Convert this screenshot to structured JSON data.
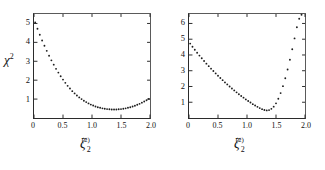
{
  "figure": {
    "background": "#ffffff",
    "ink_color": "#1d1d1d"
  },
  "chart_data": [
    {
      "type": "scatter",
      "panel_id": "I",
      "title": "",
      "xlabel": "ζ",
      "xlabel_sub": "2",
      "xlabel_sup": "(2)",
      "ylabel": "χ",
      "ylabel_sup": "2",
      "y_multiplier_text": "x 10",
      "y_multiplier_exp": "-4",
      "y_scale": 0.0001,
      "xlim": [
        0,
        2.0
      ],
      "ylim": [
        0,
        5.5
      ],
      "xticks": [
        0,
        0.5,
        1.0,
        1.5,
        2.0
      ],
      "xtick_labels": [
        "0",
        "0.5",
        "1.0",
        "1.5",
        "2.0"
      ],
      "yticks": [
        1,
        2,
        3,
        4,
        5
      ],
      "ytick_labels": [
        "1",
        "2",
        "3",
        "4",
        "5"
      ],
      "grid": false,
      "legend": "none",
      "x": [
        0.02,
        0.06,
        0.1,
        0.14,
        0.18,
        0.22,
        0.26,
        0.3,
        0.34,
        0.38,
        0.42,
        0.46,
        0.5,
        0.54,
        0.58,
        0.62,
        0.66,
        0.7,
        0.74,
        0.78,
        0.82,
        0.86,
        0.9,
        0.94,
        0.98,
        1.02,
        1.06,
        1.1,
        1.14,
        1.18,
        1.22,
        1.26,
        1.3,
        1.34,
        1.38,
        1.42,
        1.46,
        1.5,
        1.54,
        1.58,
        1.62,
        1.66,
        1.7,
        1.74,
        1.78,
        1.82,
        1.86,
        1.9,
        1.94,
        1.98
      ],
      "y": [
        5.05,
        4.72,
        4.4,
        4.1,
        3.82,
        3.55,
        3.29,
        3.05,
        2.82,
        2.6,
        2.4,
        2.21,
        2.03,
        1.86,
        1.7,
        1.56,
        1.42,
        1.3,
        1.19,
        1.09,
        1.0,
        0.91,
        0.84,
        0.77,
        0.71,
        0.66,
        0.61,
        0.57,
        0.54,
        0.51,
        0.49,
        0.47,
        0.46,
        0.45,
        0.45,
        0.45,
        0.46,
        0.47,
        0.49,
        0.51,
        0.54,
        0.57,
        0.61,
        0.65,
        0.7,
        0.75,
        0.81,
        0.87,
        0.94,
        1.01
      ],
      "minimum_x": 1.36,
      "minimum_y": 0.45
    },
    {
      "type": "scatter",
      "panel_id": "II",
      "title": "",
      "xlabel": "ζ",
      "xlabel_sub": "2",
      "xlabel_sup": "(2)",
      "ylabel": "",
      "ylabel_sup": "",
      "y_multiplier_text": "x 10",
      "y_multiplier_exp": "-2",
      "y_scale": 0.01,
      "xlim": [
        0,
        2.0
      ],
      "ylim": [
        0,
        6.6
      ],
      "xticks": [
        0,
        0.5,
        1.0,
        1.5,
        2.0
      ],
      "xtick_labels": [
        "0",
        "0.5",
        "1.0",
        "1.5",
        "2.0"
      ],
      "yticks": [
        1,
        2,
        3,
        4,
        5,
        6
      ],
      "ytick_labels": [
        "1",
        "2",
        "3",
        "4",
        "5",
        "6"
      ],
      "grid": false,
      "legend": "none",
      "x": [
        0.02,
        0.06,
        0.1,
        0.14,
        0.18,
        0.22,
        0.26,
        0.3,
        0.34,
        0.38,
        0.42,
        0.46,
        0.5,
        0.54,
        0.58,
        0.62,
        0.66,
        0.7,
        0.74,
        0.78,
        0.82,
        0.86,
        0.9,
        0.94,
        0.98,
        1.02,
        1.06,
        1.1,
        1.14,
        1.18,
        1.22,
        1.26,
        1.3,
        1.34,
        1.38,
        1.42,
        1.46,
        1.5,
        1.54,
        1.58,
        1.62,
        1.66,
        1.7,
        1.74,
        1.78,
        1.82,
        1.86,
        1.9,
        1.94
      ],
      "y": [
        4.72,
        4.52,
        4.33,
        4.14,
        3.96,
        3.79,
        3.62,
        3.45,
        3.29,
        3.13,
        2.98,
        2.83,
        2.68,
        2.54,
        2.4,
        2.26,
        2.13,
        2.0,
        1.87,
        1.75,
        1.63,
        1.51,
        1.4,
        1.29,
        1.18,
        1.08,
        0.98,
        0.88,
        0.79,
        0.71,
        0.63,
        0.56,
        0.51,
        0.48,
        0.5,
        0.58,
        0.72,
        0.93,
        1.22,
        1.58,
        2.02,
        2.52,
        3.08,
        3.7,
        4.36,
        5.05,
        5.76,
        6.3,
        6.55
      ],
      "minimum_x": 1.33,
      "minimum_y": 0.48
    }
  ]
}
